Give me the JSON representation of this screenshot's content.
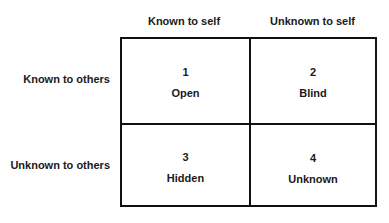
{
  "diagram": {
    "columns": [
      "Known to self",
      "Unknown to self"
    ],
    "rows": [
      "Known to others",
      "Unknown to others"
    ],
    "cells": [
      {
        "number": "1",
        "label": "Open"
      },
      {
        "number": "2",
        "label": "Blind"
      },
      {
        "number": "3",
        "label": "Hidden"
      },
      {
        "number": "4",
        "label": "Unknown"
      }
    ]
  }
}
